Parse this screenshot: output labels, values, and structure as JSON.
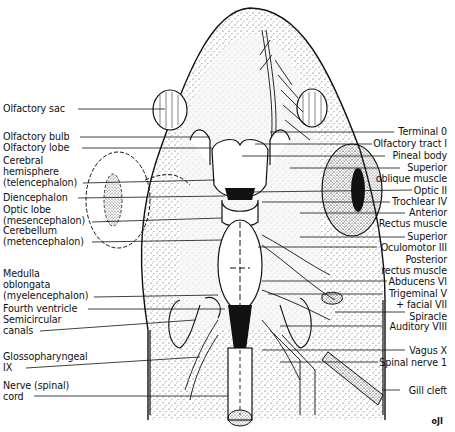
{
  "figure": {
    "figure_number": "oJI",
    "colors": {
      "ink": "#111111",
      "stipple": "#555555",
      "background": "#ffffff"
    }
  },
  "labels_left": [
    {
      "id": "olfactory-sac",
      "lines": [
        "Olfactory sac"
      ]
    },
    {
      "id": "olfactory-bulb",
      "lines": [
        "Olfactory bulb"
      ]
    },
    {
      "id": "olfactory-lobe",
      "lines": [
        "Olfactory lobe"
      ]
    },
    {
      "id": "cerebral-hemisphere",
      "lines": [
        "Cerebral",
        "hemisphere",
        "(telencephalon)"
      ]
    },
    {
      "id": "diencephalon",
      "lines": [
        "Diencephalon"
      ]
    },
    {
      "id": "optic-lobe",
      "lines": [
        "Optic lobe",
        "(mesencephalon)"
      ]
    },
    {
      "id": "cerebellum",
      "lines": [
        "Cerebellum",
        "(metencephalon)"
      ]
    },
    {
      "id": "medulla-oblongata",
      "lines": [
        "Medulla",
        "oblongata",
        "(myelencephalon)"
      ]
    },
    {
      "id": "fourth-ventricle",
      "lines": [
        "Fourth ventricle"
      ]
    },
    {
      "id": "semicircular-canals",
      "lines": [
        "Semicircular",
        "canals"
      ]
    },
    {
      "id": "glossopharyngeal",
      "lines": [
        "Glossopharyngeal",
        "IX"
      ]
    },
    {
      "id": "spinal-cord",
      "lines": [
        "Nerve (spinal)",
        "cord"
      ]
    }
  ],
  "labels_right": [
    {
      "id": "terminal-0",
      "lines": [
        "Terminal 0"
      ]
    },
    {
      "id": "olfactory-tract",
      "lines": [
        "Olfactory tract I"
      ]
    },
    {
      "id": "pineal-body",
      "lines": [
        "Pineal body"
      ]
    },
    {
      "id": "superior-oblique",
      "lines": [
        "Superior",
        "oblique muscle"
      ]
    },
    {
      "id": "optic-ii",
      "lines": [
        "Optic II"
      ]
    },
    {
      "id": "trochlear-iv",
      "lines": [
        "Trochlear IV"
      ]
    },
    {
      "id": "anterior-rectus",
      "lines": [
        "Anterior",
        "Rectus muscle"
      ]
    },
    {
      "id": "superior-rectus",
      "lines": [
        "Superior"
      ]
    },
    {
      "id": "oculomotor-iii",
      "lines": [
        "Oculomotor III"
      ]
    },
    {
      "id": "posterior-rectus",
      "lines": [
        "Posterior",
        "rectus muscle"
      ]
    },
    {
      "id": "abducens-vi",
      "lines": [
        "Abducens VI"
      ]
    },
    {
      "id": "trigeminal-facial",
      "lines": [
        "Trigeminal V",
        "+ facial VII"
      ]
    },
    {
      "id": "spiracle",
      "lines": [
        "Spiracle"
      ]
    },
    {
      "id": "auditory-viii",
      "lines": [
        "Auditory VIII"
      ]
    },
    {
      "id": "vagus-x",
      "lines": [
        "Vagus X"
      ]
    },
    {
      "id": "spinal-nerve-1",
      "lines": [
        "Spinal nerve 1"
      ]
    },
    {
      "id": "gill-cleft",
      "lines": [
        "Gill cleft"
      ]
    }
  ]
}
